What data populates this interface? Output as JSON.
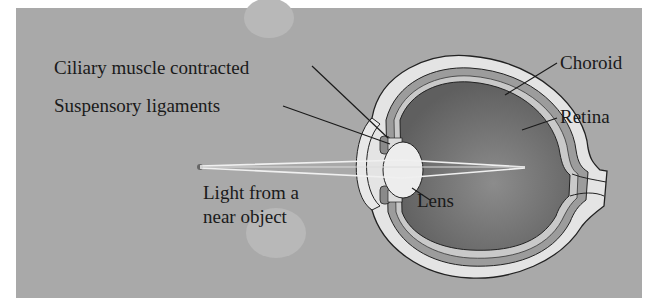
{
  "figure": {
    "type": "anatomical-diagram",
    "colors": {
      "background": "#a9a9a9",
      "sclera": "#e4e4e4",
      "choroid": "#9a9a9a",
      "retina": "#c8c8c8",
      "vitreous": "#6f6f6f",
      "lens": "#ececec",
      "outline": "#222222",
      "text": "#1a1a1a"
    }
  },
  "labels": {
    "ciliary": "Ciliary muscle contracted",
    "suspensory": "Suspensory ligaments",
    "choroid": "Choroid",
    "retina": "Retina",
    "lens": "Lens",
    "light_line1": "Light from a",
    "light_line2": "near object"
  }
}
